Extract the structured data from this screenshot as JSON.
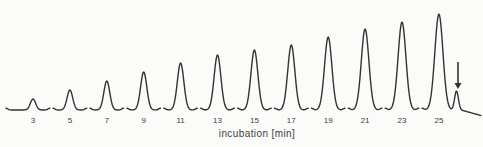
{
  "chart_data": {
    "type": "line",
    "subtype": "chromatogram_peak_train",
    "title": "",
    "xlabel": "incubation [min]",
    "ylabel": "",
    "categories": [
      "3",
      "5",
      "7",
      "9",
      "11",
      "13",
      "15",
      "17",
      "19",
      "21",
      "23",
      "25"
    ],
    "series": [
      {
        "name": "peak amplitude (relative, no y-axis shown)",
        "values": [
          0.11,
          0.21,
          0.3,
          0.4,
          0.49,
          0.57,
          0.63,
          0.68,
          0.76,
          0.84,
          0.92,
          1.0
        ]
      }
    ],
    "peak_heights_px": [
      11,
      20,
      29,
      38,
      47,
      55,
      60,
      65,
      73,
      81,
      88,
      96
    ],
    "annotation": {
      "name": "down-arrow",
      "glyph": "↓",
      "points_at": "small satellite peak after the 25 min peak"
    },
    "grid": false,
    "legend": false,
    "colors": {
      "trace": "#333333",
      "text": "#3d3d3d",
      "background": "#fbfbfa"
    },
    "layout": {
      "width": 483,
      "height": 147,
      "baseline_y": 110,
      "first_peak_center_x": 33,
      "peak_spacing_x": 36.9,
      "segment_half_width": 16.8,
      "first_segment_left_lead": 27,
      "tick_label_y": 123,
      "tick_font_px": 8,
      "xlabel_center_x": 257,
      "satellite_peak": {
        "center_x": 456.5,
        "height_px": 19,
        "sigma": 1.9
      },
      "arrow": {
        "x": 458,
        "top_y": 62,
        "tip_y": 89,
        "head_half_width": 3.5,
        "head_base_y": 83
      }
    }
  }
}
